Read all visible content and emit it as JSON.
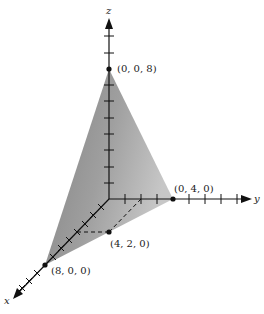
{
  "diagram": {
    "type": "3d-axes-plane",
    "axes": {
      "x": {
        "label": "x"
      },
      "y": {
        "label": "y"
      },
      "z": {
        "label": "z"
      }
    },
    "points": [
      {
        "id": "z-intercept",
        "label": "(0, 0, 8)",
        "coords": [
          0,
          0,
          8
        ]
      },
      {
        "id": "y-intercept",
        "label": "(0, 4, 0)",
        "coords": [
          0,
          4,
          0
        ]
      },
      {
        "id": "x-intercept",
        "label": "(8, 0, 0)",
        "coords": [
          8,
          0,
          0
        ]
      },
      {
        "id": "mid-point",
        "label": "(4, 2, 0)",
        "coords": [
          4,
          2,
          0
        ]
      }
    ],
    "plane_color": "#8a8a8a",
    "axis_color": "#111111"
  }
}
